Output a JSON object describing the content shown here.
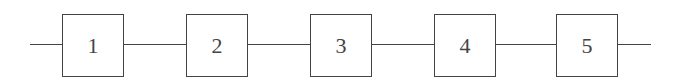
{
  "diagram": {
    "type": "series-block-chain",
    "blocks": [
      {
        "label": "1"
      },
      {
        "label": "2"
      },
      {
        "label": "3"
      },
      {
        "label": "4"
      },
      {
        "label": "5"
      }
    ],
    "line_color": "#444444"
  }
}
